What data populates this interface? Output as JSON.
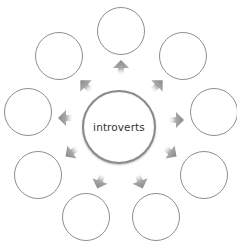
{
  "diagram": {
    "type": "radial-hub-spoke",
    "center": {
      "label": "introverts",
      "cx": 119,
      "cy": 127,
      "r": 37
    },
    "satellites": [
      {
        "id": "top",
        "label": "",
        "cx": 121,
        "cy": 31,
        "r": 24
      },
      {
        "id": "upper-right",
        "label": "",
        "cx": 183,
        "cy": 56,
        "r": 24
      },
      {
        "id": "right",
        "label": "",
        "cx": 214,
        "cy": 112,
        "r": 24
      },
      {
        "id": "lower-right",
        "label": "",
        "cx": 204,
        "cy": 175,
        "r": 24
      },
      {
        "id": "bottom-right",
        "label": "",
        "cx": 156,
        "cy": 217,
        "r": 24
      },
      {
        "id": "bottom-left",
        "label": "",
        "cx": 86,
        "cy": 217,
        "r": 24
      },
      {
        "id": "lower-left",
        "label": "",
        "cx": 38,
        "cy": 175,
        "r": 24
      },
      {
        "id": "left",
        "label": "",
        "cx": 28,
        "cy": 112,
        "r": 24
      },
      {
        "id": "upper-left",
        "label": "",
        "cx": 59,
        "cy": 56,
        "r": 24
      }
    ],
    "arrows": [
      {
        "to": "top",
        "x": 121,
        "y": 68,
        "angle": 0
      },
      {
        "to": "upper-right",
        "x": 157,
        "y": 86,
        "angle": 45
      },
      {
        "to": "right",
        "x": 176,
        "y": 120,
        "angle": 90
      },
      {
        "to": "lower-right",
        "x": 170,
        "y": 152,
        "angle": 125
      },
      {
        "to": "bottom-right",
        "x": 140,
        "y": 181,
        "angle": 160
      },
      {
        "to": "bottom-left",
        "x": 100,
        "y": 181,
        "angle": 200
      },
      {
        "to": "lower-left",
        "x": 72,
        "y": 152,
        "angle": 235
      },
      {
        "to": "left",
        "x": 66,
        "y": 118,
        "angle": 270
      },
      {
        "to": "upper-left",
        "x": 86,
        "y": 86,
        "angle": 315
      }
    ],
    "colors": {
      "stroke": "#8e8e8e",
      "arrow": "#8a8a8a",
      "text": "#333333",
      "background": "#ffffff"
    }
  }
}
